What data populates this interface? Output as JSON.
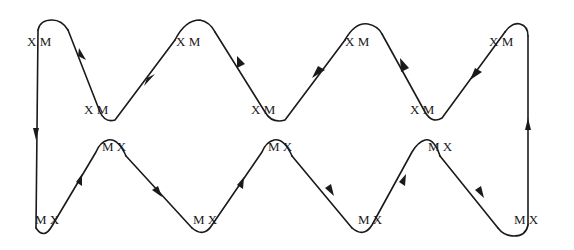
{
  "diagram": {
    "type": "serpentine-loop",
    "stroke_color": "#1a1a1a",
    "background": "#ffffff",
    "labels": [
      {
        "id": "top-peak-1",
        "x_text": "X",
        "m_text": "M",
        "x": 28,
        "y": 33
      },
      {
        "id": "top-trough-1",
        "x_text": "X",
        "m_text": "M",
        "x": 84,
        "y": 103
      },
      {
        "id": "top-peak-2",
        "x_text": "X",
        "m_text": "M",
        "x": 176,
        "y": 33
      },
      {
        "id": "top-trough-2",
        "x_text": "X",
        "m_text": "M",
        "x": 251,
        "y": 103
      },
      {
        "id": "top-peak-3",
        "x_text": "X",
        "m_text": "M",
        "x": 345,
        "y": 33
      },
      {
        "id": "top-trough-3",
        "x_text": "X",
        "m_text": "M",
        "x": 410,
        "y": 103
      },
      {
        "id": "top-peak-4",
        "x_text": "X",
        "m_text": "M",
        "x": 490,
        "y": 33
      }
    ],
    "bottom_labels": [
      {
        "id": "bottom-trough-1",
        "m_text": "M",
        "x_text": "X",
        "x": 35,
        "y": 213
      },
      {
        "id": "bottom-peak-1",
        "m_text": "M",
        "x_text": "X",
        "x": 102,
        "y": 140
      },
      {
        "id": "bottom-trough-2",
        "m_text": "M",
        "x_text": "X",
        "x": 193,
        "y": 213
      },
      {
        "id": "bottom-peak-2",
        "m_text": "M",
        "x_text": "X",
        "x": 268,
        "y": 140
      },
      {
        "id": "bottom-trough-3",
        "m_text": "M",
        "x_text": "X",
        "x": 358,
        "y": 213
      },
      {
        "id": "bottom-peak-3",
        "m_text": "M",
        "x_text": "X",
        "x": 428,
        "y": 140
      },
      {
        "id": "bottom-trough-4",
        "m_text": "M",
        "x_text": "X",
        "x": 514,
        "y": 213
      }
    ]
  }
}
